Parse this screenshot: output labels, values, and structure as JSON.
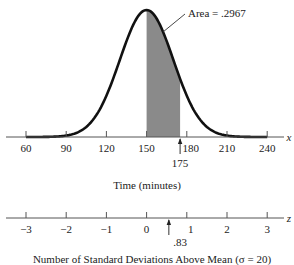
{
  "chart_data": {
    "type": "area",
    "title": "",
    "distribution": "normal",
    "mean": 150,
    "sd": 20,
    "shaded_region": {
      "from": 150,
      "to": 175,
      "area": 0.2967
    },
    "annotation": "Area = .2967",
    "x_axis": {
      "label": "Time (minutes)",
      "variable": "x",
      "ticks": [
        60,
        90,
        120,
        150,
        180,
        210,
        240
      ],
      "marker": {
        "value": 175,
        "label": "175"
      },
      "range": [
        60,
        240
      ]
    },
    "z_axis": {
      "label": "Number of Standard Deviations Above Mean (σ = 20)",
      "variable": "z",
      "ticks": [
        "−3",
        "−2",
        "−1",
        "0",
        "1",
        "2",
        "3"
      ],
      "marker": {
        "value": 0.83,
        "label": ".83"
      }
    },
    "grid": false,
    "legend": "none"
  },
  "labels": {
    "annotation": "Area = .2967",
    "x_var": "x",
    "z_var": "z",
    "x_title": "Time (minutes)",
    "z_title": "Number of Standard Deviations Above Mean (σ = 20)",
    "x_marker": "175",
    "z_marker": ".83",
    "x_ticks": [
      "60",
      "90",
      "120",
      "150",
      "180",
      "210",
      "240"
    ],
    "z_ticks": [
      "−3",
      "−2",
      "−1",
      "0",
      "1",
      "2",
      "3"
    ]
  },
  "colors": {
    "curve": "#111111",
    "shade": "#8a8a8a",
    "axis": "#555555"
  }
}
